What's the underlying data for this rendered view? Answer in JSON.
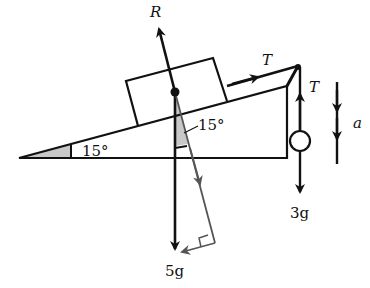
{
  "diagram": {
    "labels": {
      "reaction": "R",
      "tension_incline": "T",
      "tension_hanging": "T",
      "acceleration": "a",
      "incline_angle": "15°",
      "weight_angle": "15°",
      "block_weight": "5g",
      "hanging_weight": "3g"
    },
    "colors": {
      "ink": "#111111",
      "component": "#555555",
      "shade": "#c8c8c8"
    }
  }
}
